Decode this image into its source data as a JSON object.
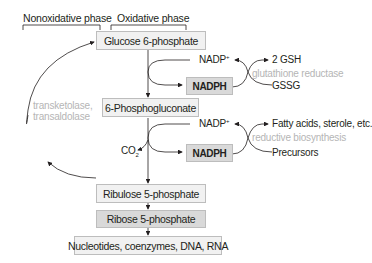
{
  "phases": {
    "nonoxidative": "Nonoxidative phase",
    "oxidative": "Oxidative phase"
  },
  "pathway": {
    "glucose6p": "Glucose 6-phosphate",
    "phosphogluconate": "6-Phosphogluconate",
    "ribulose5p": "Ribulose 5-phosphate",
    "ribose5p": "Ribose 5-phosphate",
    "products": "Nucleotides, coenzymes, DNA, RNA"
  },
  "step1": {
    "nadp": "NADP",
    "nadp_sup": "+",
    "nadph": "NADPH",
    "gsh": "2 GSH",
    "enzyme": "glutathione reductase",
    "gssg": "GSSG"
  },
  "step2": {
    "co2": "CO",
    "co2_sub": "2",
    "nadp": "NADP",
    "nadp_sup": "+",
    "nadph": "NADPH",
    "products": "Fatty acids, sterole, etc.",
    "enzyme": "reductive biosynthesis",
    "precursors": "Precursors"
  },
  "nonoxidative_enzymes": {
    "line1": "transketolase,",
    "line2": "transaldolase"
  },
  "colors": {
    "light_box": "#f1f1f1",
    "dark_box": "#d9d9d9",
    "border": "#bdbdbd",
    "grey_text": "#b5b5b5",
    "text": "#231f20"
  }
}
